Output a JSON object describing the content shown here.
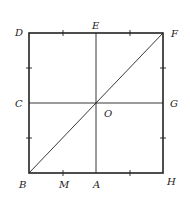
{
  "diagram": {
    "type": "geometry-square",
    "colors": {
      "stroke": "#222222",
      "background": "#ffffff"
    },
    "square": {
      "x": 29,
      "y": 33,
      "size": 134
    },
    "points": {
      "D": {
        "label": "D",
        "x": 29,
        "y": 33
      },
      "E": {
        "label": "E",
        "x": 96,
        "y": 33
      },
      "F": {
        "label": "F",
        "x": 163,
        "y": 33
      },
      "C": {
        "label": "C",
        "x": 29,
        "y": 103
      },
      "O": {
        "label": "O",
        "x": 96,
        "y": 103
      },
      "G": {
        "label": "G",
        "x": 163,
        "y": 103
      },
      "B": {
        "label": "B",
        "x": 29,
        "y": 173
      },
      "M": {
        "label": "M",
        "x": 63,
        "y": 173
      },
      "A": {
        "label": "A",
        "x": 96,
        "y": 173
      },
      "H": {
        "label": "H",
        "x": 163,
        "y": 173
      }
    },
    "segments": [
      "DF",
      "FH",
      "HB",
      "BD",
      "EA",
      "CG",
      "BF"
    ],
    "tick_marks": [
      "top-quarter-left",
      "top-quarter-right",
      "left-quarter-top",
      "left-quarter-bottom",
      "right-quarter-top",
      "right-quarter-bottom",
      "bottom-quarter-left-M",
      "bottom-quarter-right"
    ]
  }
}
